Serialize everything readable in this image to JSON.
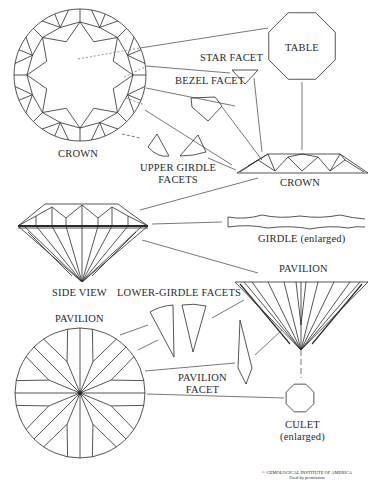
{
  "colors": {
    "ink": "#2a2a2a",
    "background": "#ffffff",
    "leader": "#555555"
  },
  "labels": {
    "crown_top": "CROWN",
    "table": "TABLE",
    "star_facet": "STAR FACET",
    "bezel_facet": "BEZEL FACET",
    "upper_girdle_line1": "UPPER GIRDLE",
    "upper_girdle_line2": "FACETS",
    "crown_side": "CROWN",
    "girdle": "GIRDLE (enlarged)",
    "side_view": "SIDE VIEW",
    "lower_girdle": "LOWER-GIRDLE FACETS",
    "pavilion_side": "PAVILION",
    "pavilion_bottom": "PAVILION",
    "pavilion_facet_line1": "PAVILION",
    "pavilion_facet_line2": "FACET",
    "culet_line1": "CULET",
    "culet_line2": "(enlarged)",
    "copyright_line1": "© GEMOLOGICAL INSTITUTE OF AMERICA",
    "copyright_line2": "Used by permission"
  }
}
